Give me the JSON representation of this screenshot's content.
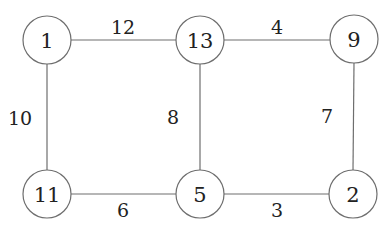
{
  "diagram": {
    "type": "weighted-undirected-graph",
    "style": {
      "line_color": "#6e6e6e",
      "text_color": "#222222",
      "background": "#ffffff",
      "node_radius": 24
    },
    "nodes": [
      {
        "id": "n1",
        "label": "1",
        "x": 47,
        "y": 40
      },
      {
        "id": "n13",
        "label": "13",
        "x": 200,
        "y": 40
      },
      {
        "id": "n9",
        "label": "9",
        "x": 354,
        "y": 40
      },
      {
        "id": "n11",
        "label": "11",
        "x": 47,
        "y": 194
      },
      {
        "id": "n5",
        "label": "5",
        "x": 200,
        "y": 194
      },
      {
        "id": "n2",
        "label": "2",
        "x": 353,
        "y": 194
      }
    ],
    "edges": [
      {
        "from": "1",
        "to": "13",
        "weight": "12",
        "label_x": 123,
        "label_y": 27
      },
      {
        "from": "13",
        "to": "9",
        "weight": "4",
        "label_x": 277,
        "label_y": 27
      },
      {
        "from": "1",
        "to": "11",
        "weight": "10",
        "label_x": 20,
        "label_y": 118
      },
      {
        "from": "13",
        "to": "5",
        "weight": "8",
        "label_x": 173,
        "label_y": 117
      },
      {
        "from": "9",
        "to": "2",
        "weight": "7",
        "label_x": 327,
        "label_y": 116
      },
      {
        "from": "11",
        "to": "5",
        "weight": "6",
        "label_x": 123,
        "label_y": 210
      },
      {
        "from": "5",
        "to": "2",
        "weight": "3",
        "label_x": 277,
        "label_y": 210
      }
    ]
  }
}
